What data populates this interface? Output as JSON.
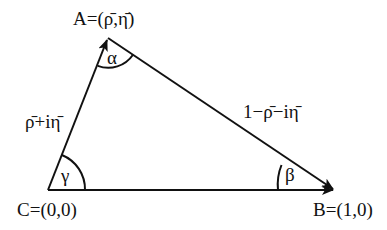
{
  "diagram": {
    "type": "unitarity-triangle",
    "vertices": {
      "A": {
        "label": "A=(ρ̄,η̄)",
        "name": "A",
        "coords": "(ρ̄,η̄)"
      },
      "B": {
        "label": "B=(1,0)",
        "name": "B",
        "coords": "(1,0)"
      },
      "C": {
        "label": "C=(0,0)",
        "name": "C",
        "coords": "(0,0)"
      }
    },
    "sides": {
      "CA": {
        "label": "ρ̄+iη̄"
      },
      "AB": {
        "label": "1−ρ̄−iη̄"
      },
      "CB": {
        "label": ""
      }
    },
    "angles": {
      "alpha": {
        "symbol": "α",
        "vertex": "A"
      },
      "beta": {
        "symbol": "β",
        "vertex": "B"
      },
      "gamma": {
        "symbol": "γ",
        "vertex": "C"
      }
    },
    "colors": {
      "stroke": "#111111",
      "background": "#ffffff"
    }
  }
}
